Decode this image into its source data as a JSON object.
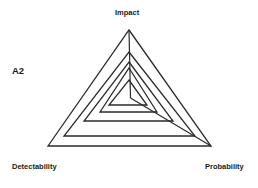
{
  "chart_data": {
    "type": "radar",
    "title": "A2",
    "axes": [
      "Impact",
      "Probability",
      "Detectability"
    ],
    "levels": 5,
    "grid": true,
    "series_note": "Nested triangular rings (grid levels) with axis lines from center to Impact and Probability vertices",
    "rings": [
      {
        "level": 5,
        "points": [
          [
            129,
            30
          ],
          [
            211,
            146
          ],
          [
            48,
            146
          ]
        ]
      },
      {
        "level": 4,
        "points": [
          [
            129,
            52
          ],
          [
            195,
            136
          ],
          [
            64,
            136
          ]
        ]
      },
      {
        "level": 3,
        "points": [
          [
            129,
            62
          ],
          [
            173,
            121
          ],
          [
            84,
            121
          ]
        ]
      },
      {
        "level": 2,
        "points": [
          [
            129,
            68
          ],
          [
            157,
            112
          ],
          [
            100,
            112
          ]
        ]
      },
      {
        "level": 1,
        "points": [
          [
            129,
            80
          ],
          [
            147,
            105
          ],
          [
            109,
            105
          ]
        ]
      }
    ],
    "center": [
      130.5,
      98
    ],
    "line_color": "#2b2b2b"
  },
  "labels": {
    "title": "A2",
    "axis_top": "Impact",
    "axis_left": "Detectability",
    "axis_right": "Probability"
  }
}
